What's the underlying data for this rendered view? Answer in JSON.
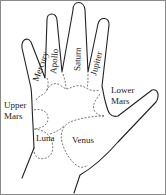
{
  "diagram": {
    "labels": {
      "mercury": "Mercury",
      "apollo": "Apollo",
      "saturn": "Saturn",
      "jupiter": "Jupiter",
      "lower_mars_1": "Lower",
      "lower_mars_2": "Mars",
      "upper_mars_1": "Upper",
      "upper_mars_2": "Mars",
      "luna": "Luna",
      "venus": "Venus"
    },
    "colors": {
      "line": "#222222",
      "dashed": "#555555",
      "border": "#8a8a8a",
      "background": "#ffffff"
    }
  }
}
